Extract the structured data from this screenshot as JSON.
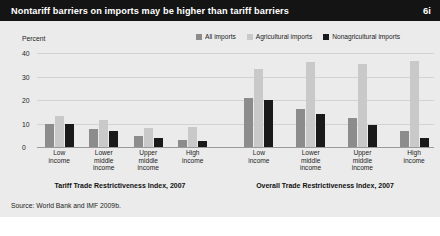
{
  "header": {
    "title": "Nontariff barriers on imports may be higher than tariff barriers",
    "figure_number": "6i"
  },
  "legend": {
    "position": "top-right",
    "items": [
      {
        "label": "All imports",
        "color": "#8c8c8c",
        "swatch_name": "legend-swatch-all-imports"
      },
      {
        "label": "Agricultural imports",
        "color": "#c9c9c9",
        "swatch_name": "legend-swatch-agricultural-imports"
      },
      {
        "label": "Nonagricultural imports",
        "color": "#1a1a1a",
        "swatch_name": "legend-swatch-nonagricultural-imports"
      }
    ]
  },
  "axis": {
    "ylabel": "Percent",
    "ticks": [
      "40",
      "30",
      "20",
      "10",
      "0"
    ]
  },
  "source": "Source: World Bank and IMF 2009b.",
  "chart_data": [
    {
      "type": "bar",
      "title": "Tariff Trade Restrictiveness Index, 2007",
      "xlabel": "",
      "ylabel": "Percent",
      "ylim": [
        0,
        40
      ],
      "yticks": [
        0,
        10,
        20,
        30,
        40
      ],
      "grid": true,
      "legend_position": "top-right",
      "categories": [
        "Low income",
        "Lower middle income",
        "Upper middle income",
        "High income"
      ],
      "series": [
        {
          "name": "All imports",
          "color": "#8c8c8c",
          "values": [
            10,
            7.5,
            4.5,
            3
          ]
        },
        {
          "name": "Agricultural imports",
          "color": "#c9c9c9",
          "values": [
            13,
            11.5,
            8,
            8.5
          ]
        },
        {
          "name": "Nonagricultural imports",
          "color": "#1a1a1a",
          "values": [
            10,
            7,
            4,
            2.5
          ]
        }
      ]
    },
    {
      "type": "bar",
      "title": "Overall Trade Restrictiveness Index, 2007",
      "xlabel": "",
      "ylabel": "Percent",
      "ylim": [
        0,
        40
      ],
      "yticks": [
        0,
        10,
        20,
        30,
        40
      ],
      "grid": true,
      "legend_position": "top-right",
      "categories": [
        "Low income",
        "Lower middle income",
        "Upper middle income",
        "High income"
      ],
      "series": [
        {
          "name": "All imports",
          "color": "#8c8c8c",
          "values": [
            21,
            16,
            12.5,
            7
          ]
        },
        {
          "name": "Agricultural imports",
          "color": "#c9c9c9",
          "values": [
            33,
            36,
            35.5,
            36.5
          ]
        },
        {
          "name": "Nonagricultural imports",
          "color": "#1a1a1a",
          "values": [
            20,
            14,
            9.5,
            4
          ]
        }
      ]
    }
  ]
}
